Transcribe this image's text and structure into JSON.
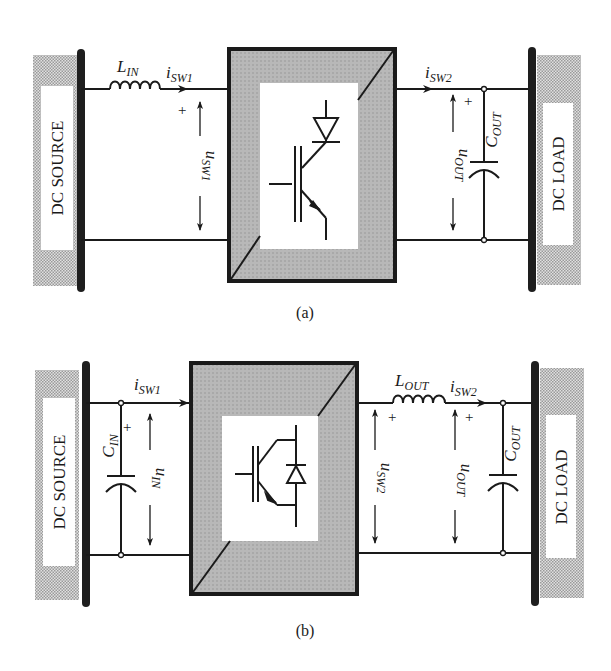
{
  "colors": {
    "wire": "#1a1a1a",
    "bus_bar": "#1e1e1e",
    "switch_fill": "#b4b4b4",
    "hatch": "#c8c8c8",
    "background": "#ffffff"
  },
  "diagram_a": {
    "caption": "(a)",
    "source_label": "DC SOURCE",
    "load_label": "DC LOAD",
    "inductor": {
      "symbol": "L",
      "subscript": "IN"
    },
    "current_in": {
      "symbol": "i",
      "subscript": "SW1"
    },
    "voltage_in": {
      "symbol": "u",
      "subscript": "SW1",
      "polarity": "+"
    },
    "current_out": {
      "symbol": "i",
      "subscript": "SW2"
    },
    "voltage_out": {
      "symbol": "u",
      "subscript": "OUT",
      "polarity": "+"
    },
    "capacitor_out": {
      "symbol": "C",
      "subscript": "OUT"
    },
    "switch_type": "IGBT with series diode"
  },
  "diagram_b": {
    "caption": "(b)",
    "source_label": "DC SOURCE",
    "load_label": "DC LOAD",
    "capacitor_in": {
      "symbol": "C",
      "subscript": "IN"
    },
    "voltage_in": {
      "symbol": "u",
      "subscript": "IN",
      "polarity": "+"
    },
    "current_in": {
      "symbol": "i",
      "subscript": "SW1"
    },
    "inductor": {
      "symbol": "L",
      "subscript": "OUT"
    },
    "current_out": {
      "symbol": "i",
      "subscript": "SW2"
    },
    "voltage_sw": {
      "symbol": "u",
      "subscript": "SW2",
      "polarity": "+"
    },
    "voltage_out": {
      "symbol": "u",
      "subscript": "OUT",
      "polarity": "+"
    },
    "capacitor_out": {
      "symbol": "C",
      "subscript": "OUT"
    },
    "switch_type": "IGBT with anti-parallel diode"
  }
}
